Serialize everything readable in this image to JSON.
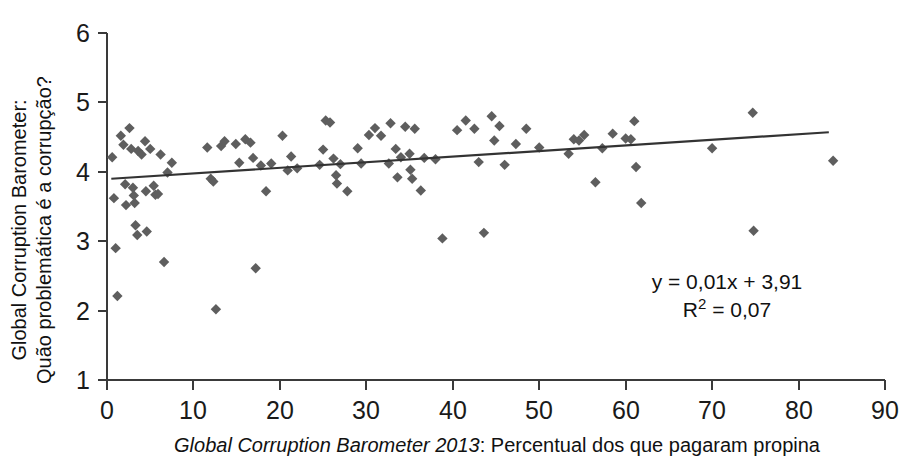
{
  "chart_data": {
    "type": "scatter",
    "title": "",
    "xlabel_italic": "Global Corruption Barometer 2013",
    "xlabel_rest": ": Percentual dos que pagaram propina",
    "ylabel_line1": "Global Corruption Barometer:",
    "ylabel_line2": "Quão problemática é a corrupção?",
    "xlim": [
      0,
      90
    ],
    "ylim": [
      1,
      6
    ],
    "xticks": [
      0,
      10,
      20,
      30,
      40,
      50,
      60,
      70,
      80,
      90
    ],
    "yticks": [
      1,
      2,
      3,
      4,
      5,
      6
    ],
    "xtick_labels": [
      "0",
      "10",
      "20",
      "30",
      "40",
      "50",
      "60",
      "70",
      "80",
      "90"
    ],
    "ytick_labels": [
      "1",
      "2",
      "3",
      "4",
      "5",
      "6"
    ],
    "grid": false,
    "legend": false,
    "marker_shape": "diamond",
    "marker_color": "#5e5e5e",
    "trendline_color": "#333333",
    "annotations": {
      "equation": "y = 0,01x + 3,91",
      "r_squared_prefix": "R",
      "r_squared_exponent": "2",
      "r_squared_value": " = 0,07"
    },
    "trendline": {
      "slope": 0.01,
      "intercept": 3.91,
      "r2": 0.07,
      "x_start": 0.5,
      "x_end": 83.5,
      "y_start": 3.9,
      "y_end": 4.57
    },
    "points": [
      [
        0.6,
        4.21
      ],
      [
        0.8,
        3.62
      ],
      [
        1.0,
        2.9
      ],
      [
        1.2,
        2.21
      ],
      [
        1.6,
        4.52
      ],
      [
        1.9,
        4.39
      ],
      [
        2.1,
        3.82
      ],
      [
        2.2,
        3.52
      ],
      [
        2.6,
        4.63
      ],
      [
        2.8,
        4.33
      ],
      [
        3.0,
        3.77
      ],
      [
        3.1,
        3.66
      ],
      [
        3.2,
        3.55
      ],
      [
        3.3,
        3.23
      ],
      [
        3.5,
        3.09
      ],
      [
        3.6,
        4.3
      ],
      [
        4.0,
        4.25
      ],
      [
        4.4,
        4.44
      ],
      [
        4.5,
        3.72
      ],
      [
        4.6,
        3.14
      ],
      [
        5.0,
        4.33
      ],
      [
        5.4,
        3.8
      ],
      [
        5.6,
        3.67
      ],
      [
        5.9,
        3.68
      ],
      [
        6.2,
        4.25
      ],
      [
        6.6,
        2.7
      ],
      [
        7.0,
        3.99
      ],
      [
        7.5,
        4.13
      ],
      [
        11.6,
        4.35
      ],
      [
        12.0,
        3.9
      ],
      [
        12.3,
        3.86
      ],
      [
        12.6,
        2.02
      ],
      [
        13.2,
        4.37
      ],
      [
        13.6,
        4.44
      ],
      [
        14.9,
        4.4
      ],
      [
        15.3,
        4.13
      ],
      [
        16.0,
        4.47
      ],
      [
        16.6,
        4.42
      ],
      [
        16.9,
        4.2
      ],
      [
        17.2,
        2.61
      ],
      [
        17.8,
        4.09
      ],
      [
        18.4,
        3.72
      ],
      [
        19.0,
        4.12
      ],
      [
        20.3,
        4.52
      ],
      [
        20.9,
        4.02
      ],
      [
        21.3,
        4.22
      ],
      [
        22.0,
        4.05
      ],
      [
        24.6,
        4.1
      ],
      [
        25.0,
        4.32
      ],
      [
        25.3,
        4.74
      ],
      [
        25.8,
        4.71
      ],
      [
        26.2,
        4.19
      ],
      [
        26.5,
        3.95
      ],
      [
        26.6,
        3.83
      ],
      [
        27.0,
        4.11
      ],
      [
        27.8,
        3.72
      ],
      [
        29.0,
        4.34
      ],
      [
        29.4,
        4.12
      ],
      [
        30.3,
        4.53
      ],
      [
        31.0,
        4.63
      ],
      [
        31.7,
        4.52
      ],
      [
        32.6,
        4.12
      ],
      [
        32.8,
        4.7
      ],
      [
        33.4,
        4.33
      ],
      [
        33.6,
        3.92
      ],
      [
        34.0,
        4.21
      ],
      [
        34.5,
        4.65
      ],
      [
        35.0,
        4.26
      ],
      [
        35.1,
        4.03
      ],
      [
        35.3,
        3.9
      ],
      [
        35.6,
        4.62
      ],
      [
        36.3,
        3.73
      ],
      [
        36.7,
        4.2
      ],
      [
        38.0,
        4.18
      ],
      [
        38.8,
        3.04
      ],
      [
        40.5,
        4.6
      ],
      [
        41.5,
        4.74
      ],
      [
        42.5,
        4.62
      ],
      [
        43.0,
        4.14
      ],
      [
        43.6,
        3.12
      ],
      [
        44.5,
        4.8
      ],
      [
        44.8,
        4.45
      ],
      [
        45.4,
        4.66
      ],
      [
        46.0,
        4.1
      ],
      [
        47.3,
        4.4
      ],
      [
        48.5,
        4.62
      ],
      [
        50.0,
        4.35
      ],
      [
        53.4,
        4.26
      ],
      [
        54.0,
        4.47
      ],
      [
        54.6,
        4.45
      ],
      [
        55.2,
        4.53
      ],
      [
        56.5,
        3.85
      ],
      [
        57.3,
        4.34
      ],
      [
        58.5,
        4.55
      ],
      [
        60.0,
        4.48
      ],
      [
        60.6,
        4.47
      ],
      [
        61.0,
        4.73
      ],
      [
        61.2,
        4.07
      ],
      [
        61.8,
        3.55
      ],
      [
        70.0,
        4.34
      ],
      [
        74.7,
        4.85
      ],
      [
        74.8,
        3.15
      ],
      [
        84.0,
        4.16
      ]
    ]
  },
  "axes_geometry": {
    "plot_left_px": 107,
    "plot_right_px": 885,
    "plot_top_px": 33,
    "plot_bottom_px": 380
  }
}
